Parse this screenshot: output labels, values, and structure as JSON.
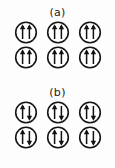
{
  "figure": {
    "background_color": "#fdfdfd",
    "ink_color": "#111111",
    "panels": [
      {
        "id": "a",
        "label": "(a)",
        "description": "parallel spin pairs",
        "rows": [
          {
            "cells": [
              {
                "left_arrow": "up",
                "right_arrow": "up"
              },
              {
                "left_arrow": "up",
                "right_arrow": "up"
              },
              {
                "left_arrow": "up",
                "right_arrow": "up"
              }
            ]
          },
          {
            "cells": [
              {
                "left_arrow": "up",
                "right_arrow": "up"
              },
              {
                "left_arrow": "up",
                "right_arrow": "up"
              },
              {
                "left_arrow": "up",
                "right_arrow": "up"
              }
            ]
          }
        ]
      },
      {
        "id": "b",
        "label": "(b)",
        "description": "antiparallel spin pairs",
        "rows": [
          {
            "cells": [
              {
                "left_arrow": "up",
                "right_arrow": "down"
              },
              {
                "left_arrow": "up",
                "right_arrow": "down"
              },
              {
                "left_arrow": "up",
                "right_arrow": "down"
              }
            ]
          },
          {
            "cells": [
              {
                "left_arrow": "up",
                "right_arrow": "down"
              },
              {
                "left_arrow": "up",
                "right_arrow": "down"
              },
              {
                "left_arrow": "up",
                "right_arrow": "down"
              }
            ]
          }
        ]
      }
    ]
  }
}
